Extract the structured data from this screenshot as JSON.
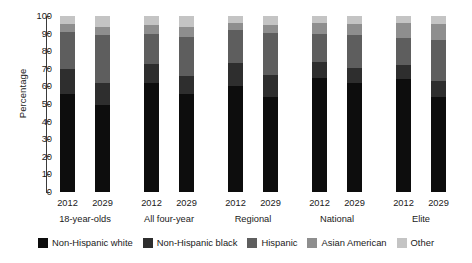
{
  "chart_data": {
    "type": "bar",
    "subtype": "stacked-bar-100",
    "title": "",
    "xlabel": "",
    "ylabel": "Percentage",
    "ylim": [
      0,
      100
    ],
    "yticks": [
      0,
      10,
      20,
      30,
      40,
      50,
      60,
      70,
      80,
      90,
      100
    ],
    "grid": false,
    "legend_position": "bottom",
    "categories": [
      "18-year-olds 2012",
      "18-year-olds 2029",
      "All four-year 2012",
      "All four-year 2029",
      "Regional 2012",
      "Regional 2029",
      "National 2012",
      "National 2029",
      "Elite 2012",
      "Elite 2029"
    ],
    "groups": [
      {
        "label": "18-year-olds",
        "years": [
          "2012",
          "2029"
        ]
      },
      {
        "label": "All four-year",
        "years": [
          "2012",
          "2029"
        ]
      },
      {
        "label": "Regional",
        "years": [
          "2012",
          "2029"
        ]
      },
      {
        "label": "National",
        "years": [
          "2012",
          "2029"
        ]
      },
      {
        "label": "Elite",
        "years": [
          "2012",
          "2029"
        ]
      }
    ],
    "series": [
      {
        "name": "Non-Hispanic white",
        "color": "#0d0d0d",
        "values": [
          55.5,
          49.5,
          62.0,
          55.5,
          60.5,
          54.0,
          65.0,
          62.0,
          64.0,
          54.0
        ]
      },
      {
        "name": "Non-Hispanic black",
        "color": "#2e2e2e",
        "values": [
          14.5,
          12.5,
          11.0,
          10.5,
          13.0,
          12.5,
          9.0,
          8.5,
          8.0,
          9.0
        ]
      },
      {
        "name": "Hispanic",
        "color": "#5e5e5e",
        "values": [
          21.0,
          27.0,
          17.0,
          22.0,
          18.5,
          24.0,
          16.0,
          19.0,
          15.5,
          23.5
        ]
      },
      {
        "name": "Asian American",
        "color": "#8e8e8e",
        "values": [
          4.5,
          5.0,
          5.0,
          5.5,
          4.0,
          4.5,
          6.0,
          6.0,
          8.5,
          9.0
        ]
      },
      {
        "name": "Other",
        "color": "#c4c4c4",
        "values": [
          4.5,
          6.0,
          5.0,
          6.5,
          4.0,
          5.0,
          4.0,
          4.5,
          4.0,
          4.5
        ]
      }
    ]
  },
  "axis": {
    "ylabel": "Percentage",
    "ticks": [
      "0",
      "10",
      "20",
      "30",
      "40",
      "50",
      "60",
      "70",
      "80",
      "90",
      "100"
    ]
  },
  "legend": {
    "items": [
      {
        "label": "Non-Hispanic white",
        "color": "#0d0d0d"
      },
      {
        "label": "Non-Hispanic black",
        "color": "#2e2e2e"
      },
      {
        "label": "Hispanic",
        "color": "#5e5e5e"
      },
      {
        "label": "Asian American",
        "color": "#8e8e8e"
      },
      {
        "label": "Other",
        "color": "#c4c4c4"
      }
    ]
  }
}
